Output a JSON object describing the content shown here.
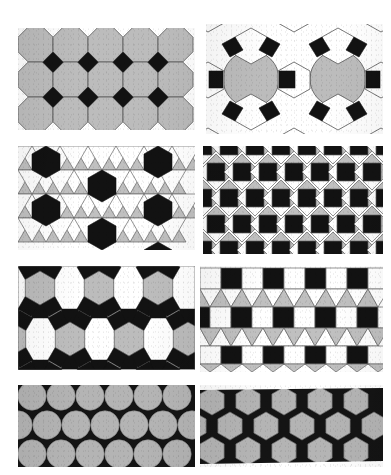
{
  "document": {
    "title": "Plate of eight periodic plane tilings",
    "background_color": "#ffffff",
    "page_width": 391,
    "page_height": 475,
    "figure_count": 8
  },
  "palette": {
    "gray_fill": "#b9b9b9",
    "gray_fill_alt": "#b2b2b2",
    "black_fill": "#101010",
    "white_fill": "#ffffff",
    "edge_stroke": "#4a4a4a",
    "edge_stroke_light": "#707070",
    "paper": "#ffffff"
  },
  "panels": [
    {
      "index": 1,
      "name": "truncated-square-tiling",
      "vertex_configuration": "4.8.8",
      "shapes": [
        "octagon",
        "square"
      ],
      "colors": {
        "octagon": "#b9b9b9",
        "square": "#101010"
      },
      "rows": 3,
      "columns": 5,
      "x": 18,
      "y": 28,
      "width": 177,
      "height": 102
    },
    {
      "index": 2,
      "name": "truncated-trihexagonal-tiling",
      "vertex_configuration": "4.6.12",
      "shapes": [
        "dodecagon",
        "hexagon",
        "square"
      ],
      "colors": {
        "dodecagon": "#b9b9b9",
        "hexagon": "#ffffff",
        "square": "#101010"
      },
      "rows": 3,
      "columns": 2,
      "x": 206,
      "y": 24,
      "width": 177,
      "height": 110
    },
    {
      "index": 3,
      "name": "snub-trihexagonal-tiling",
      "vertex_configuration": "3.3.3.3.6",
      "shapes": [
        "hexagon",
        "triangle"
      ],
      "colors": {
        "hexagon": "#101010",
        "triangle_a": "#b9b9b9",
        "triangle_b": "#ffffff"
      },
      "rows": 4,
      "columns": 6,
      "x": 18,
      "y": 146,
      "width": 177,
      "height": 104
    },
    {
      "index": 4,
      "name": "snub-square-tiling",
      "vertex_configuration": "3.3.4.3.4",
      "shapes": [
        "square",
        "triangle"
      ],
      "colors": {
        "square": "#101010",
        "triangle_a": "#b9b9b9",
        "triangle_b": "#ffffff"
      },
      "rows": 5,
      "columns": 7,
      "x": 203,
      "y": 146,
      "width": 180,
      "height": 108
    },
    {
      "index": 5,
      "name": "rhombitrihexagonal-tiling",
      "vertex_configuration": "3.4.6.4",
      "shapes": [
        "hexagon",
        "square",
        "triangle"
      ],
      "colors": {
        "hexagon": "#b9b9b9",
        "square": "#101010",
        "triangle": "#ffffff"
      },
      "rows": 2,
      "columns": 3,
      "x": 18,
      "y": 266,
      "width": 177,
      "height": 104
    },
    {
      "index": 6,
      "name": "elongated-triangular-tiling",
      "vertex_configuration": "3.3.3.4.4",
      "shapes": [
        "square",
        "triangle"
      ],
      "colors": {
        "square_a": "#101010",
        "square_b": "#ffffff",
        "triangle_a": "#b9b9b9",
        "triangle_b": "#ffffff"
      },
      "rows": 3,
      "columns": 8,
      "x": 200,
      "y": 266,
      "width": 183,
      "height": 106
    },
    {
      "index": 7,
      "name": "hexagonal-circle-packing",
      "vertex_configuration": "circle packing",
      "shapes": [
        "circle"
      ],
      "colors": {
        "circle": "#b2b2b2",
        "interstice": "#101010"
      },
      "rows": 3,
      "columns": 6,
      "x": 18,
      "y": 385,
      "width": 177,
      "height": 82
    },
    {
      "index": 8,
      "name": "trihexagonal-tiling",
      "vertex_configuration": "3.6.3.6",
      "shapes": [
        "hexagon",
        "triangle"
      ],
      "colors": {
        "hexagon": "#b2b2b2",
        "triangle": "#101010"
      },
      "rows": 3,
      "columns": 5,
      "x": 200,
      "y": 385,
      "width": 183,
      "height": 82
    }
  ]
}
